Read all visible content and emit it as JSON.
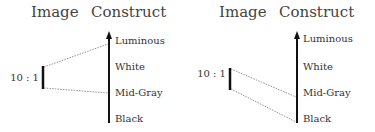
{
  "panels": [
    {
      "header_image": "Image",
      "header_construct": "Construct",
      "ratio_label": "10 : 1",
      "construct_levels": [
        "Luminous",
        "White",
        "Mid-Gray",
        "Black"
      ],
      "mapping": {
        "top_maps_to": "Luminous",
        "bottom_maps_to": "Mid-Gray"
      }
    },
    {
      "header_image": "Image",
      "header_construct": "Construct",
      "ratio_label": "10 : 1",
      "construct_levels": [
        "Luminous",
        "White",
        "Mid-Gray",
        "Black"
      ],
      "mapping": {
        "top_maps_to": "Mid-Gray",
        "bottom_maps_to": "Black"
      }
    }
  ]
}
